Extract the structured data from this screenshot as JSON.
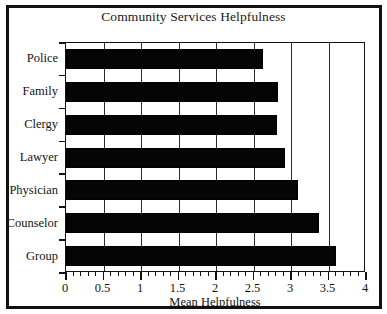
{
  "chart_data": {
    "type": "bar",
    "orientation": "horizontal",
    "title": "Community Services Helpfulness",
    "xlabel": "Mean Helpfulness",
    "ylabel": "",
    "categories": [
      "Police",
      "Family",
      "Clergy",
      "Lawyer",
      "Physician",
      "Counselor",
      "Group"
    ],
    "values": [
      2.63,
      2.83,
      2.81,
      2.92,
      3.09,
      3.37,
      3.6
    ],
    "xlim": [
      0,
      4
    ],
    "xticks": [
      0,
      0.5,
      1,
      1.5,
      2,
      2.5,
      3,
      3.5,
      4
    ],
    "xticklabels": [
      "0",
      "0.5",
      "1",
      "1.5",
      "2",
      "2.5",
      "3",
      "3.5",
      "4"
    ],
    "minor_ticks_per_interval": 5,
    "grid": "vertical",
    "legend": "none",
    "bar_color": "#050505",
    "background_color": "#ffffff",
    "frame_color": "#111111"
  }
}
